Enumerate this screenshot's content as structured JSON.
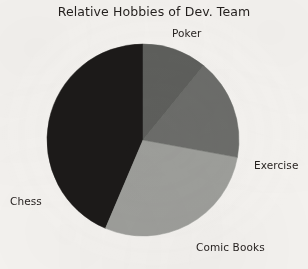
{
  "chart_data": {
    "type": "pie",
    "title": "Relative Hobbies of Dev. Team",
    "categories": [
      "Poker",
      "Exercise",
      "Comic Books",
      "Chess"
    ],
    "values": [
      43.5,
      11.0,
      17.0,
      28.5
    ],
    "units": "percent",
    "start_angle_deg": 90,
    "direction": "counterclockwise",
    "labels_position": "outside",
    "legend": "none",
    "grid": false,
    "slices": [
      {
        "label": "Poker",
        "value": 43.5,
        "color": "#1c1a19",
        "start_deg": 90,
        "end_deg": 247.0,
        "label_x": 172,
        "label_y": 27
      },
      {
        "label": "Chess",
        "value": 28.5,
        "color": "#9fa09c",
        "start_deg": 247.0,
        "end_deg": 349.6,
        "label_x": 10,
        "label_y": 195
      },
      {
        "label": "Comic Books",
        "value": 17.0,
        "color": "#6d6e6b",
        "start_deg": 349.6,
        "end_deg": 410.8,
        "label_x": 196,
        "label_y": 241
      },
      {
        "label": "Exercise",
        "value": 11.0,
        "color": "#5f605d",
        "start_deg": 410.8,
        "end_deg": 450.0,
        "label_x": 254,
        "label_y": 159
      }
    ],
    "geometry": {
      "center_x": 143,
      "center_y": 140,
      "radius": 96
    },
    "colors": {
      "background": "#f6f4f1",
      "text": "#241f1d",
      "poker": "#1c1a19",
      "chess": "#9fa09c",
      "comic_books": "#6d6e6b",
      "exercise": "#5f605d"
    }
  },
  "labels": {
    "poker": "Poker",
    "exercise": "Exercise",
    "comic_books": "Comic Books",
    "chess": "Chess"
  }
}
